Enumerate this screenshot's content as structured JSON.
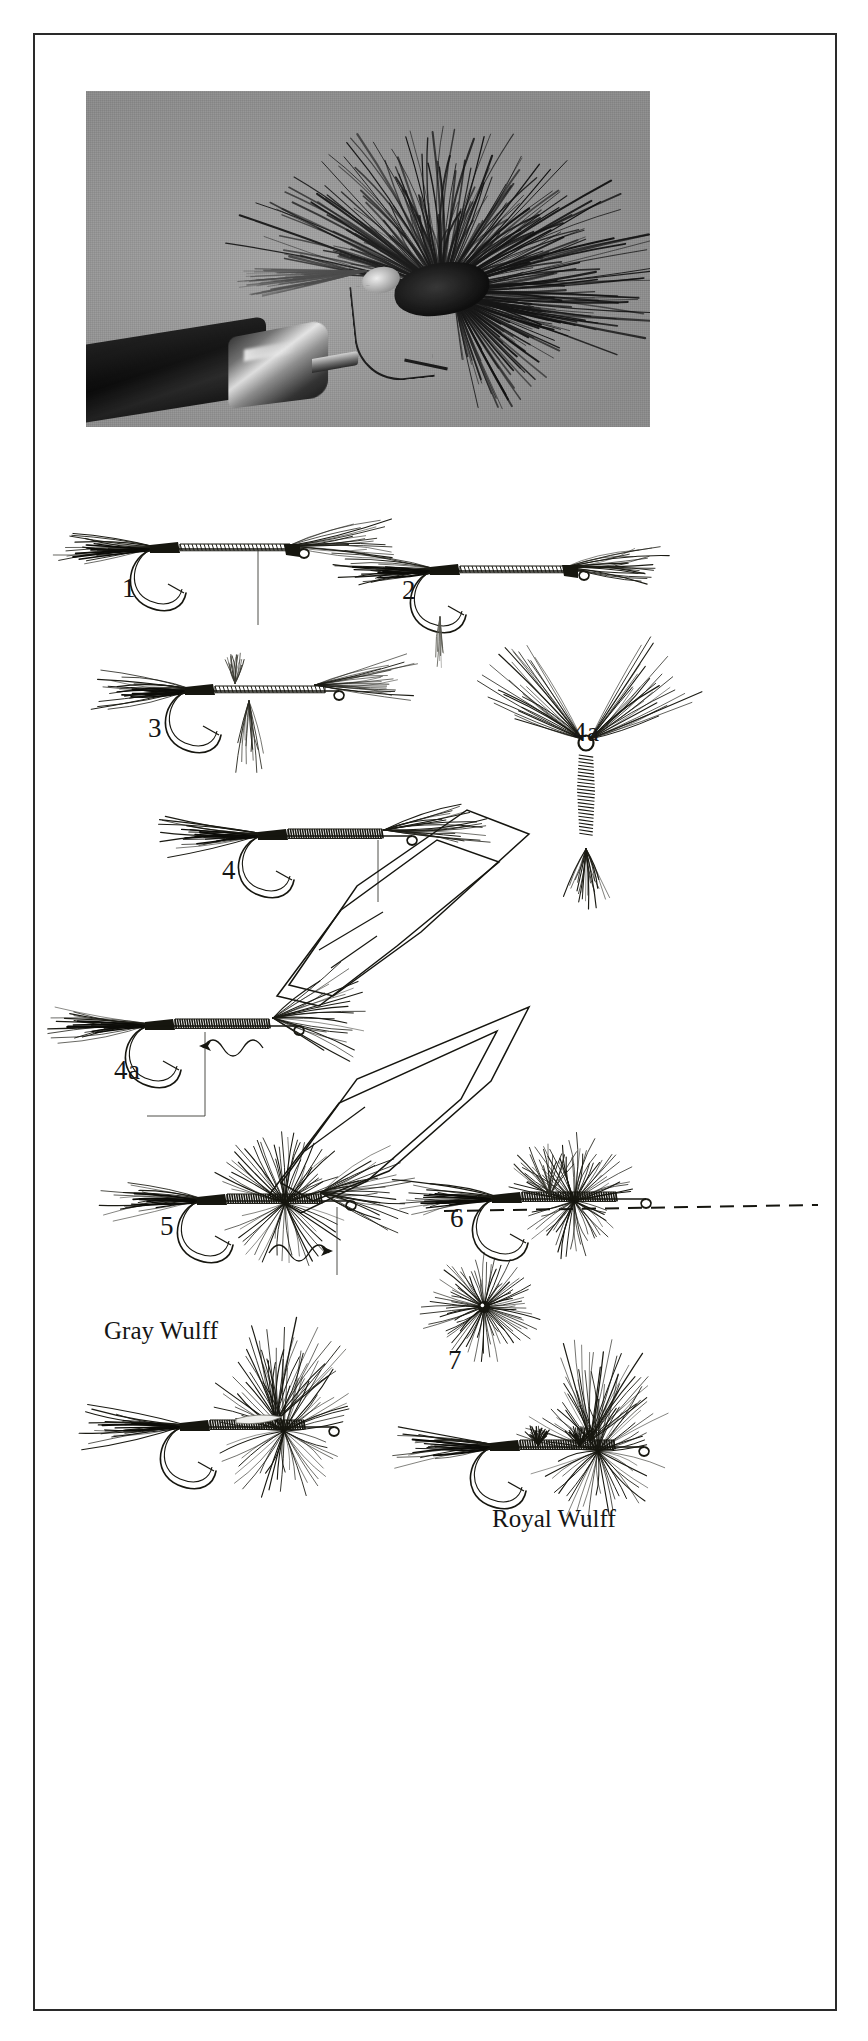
{
  "page": {
    "kind": "book-plate",
    "title_visible": false,
    "background_color": "#ffffff",
    "border_color": "#2a2a2a"
  },
  "photo": {
    "name": "tied-fly-photograph",
    "background_color": "#9d9d9d",
    "subject": "dark hair-wing dry fly held in a fly-tying vise",
    "caption": ""
  },
  "diagram": {
    "title": "",
    "steps": [
      {
        "id": "step-1",
        "label": "1",
        "description": "hook in vise with thread base wrapped along shank, tail fibers tied in at rear and wing bunch tied in at front"
      },
      {
        "id": "step-2",
        "label": "2",
        "description": "wing bunch stood upright, thread taken forward, tail fibers secured"
      },
      {
        "id": "step-3",
        "label": "3",
        "description": "wing divided and posted, thread wraps built at wing base"
      },
      {
        "id": "step-4",
        "label": "4",
        "description": "dubbed or wrapped body formed along the shank up to the wing"
      },
      {
        "id": "step-4a",
        "label": "4a",
        "description": "front view of the divided upright wings figure-eighted on the hook eye"
      },
      {
        "id": "step-5",
        "label": "5",
        "description": "hackle tied in behind the wing, thread spiral shown by arrows"
      },
      {
        "id": "step-6",
        "label": "6",
        "description": "hackle wound through and in front of the wings, tie-off arrows shown"
      },
      {
        "id": "step-7",
        "label": "7",
        "description": "finished hackle trimmed level, dashed line shows the hackle plane"
      },
      {
        "id": "step-7a",
        "label": "7a",
        "description": "head-on view of the finished hackle collar around the hook eye"
      }
    ],
    "finished_flies": [
      {
        "id": "fly-gray-wulff",
        "label": "Gray Wulff"
      },
      {
        "id": "fly-royal-wulff",
        "label": "Royal Wulff"
      }
    ]
  }
}
